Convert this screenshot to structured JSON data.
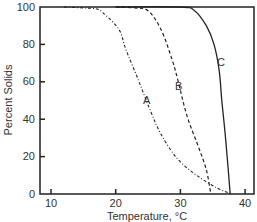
{
  "chart_data": {
    "type": "line",
    "title": "",
    "xlabel": "Temperature, °C",
    "ylabel": "Percent Solids",
    "xlim": [
      8,
      42
    ],
    "ylim": [
      0,
      100
    ],
    "xticks": [
      10,
      20,
      30,
      40
    ],
    "yticks": [
      0,
      20,
      40,
      60,
      80,
      100
    ],
    "grid": false,
    "legend": "inline curve labels",
    "series": [
      {
        "name": "A",
        "style": "dash-dot",
        "x": [
          12,
          15,
          17,
          18,
          20.5,
          21.6,
          23.5,
          25.3,
          27,
          29.5,
          32.5,
          35.8,
          38
        ],
        "y": [
          100,
          99.5,
          99,
          97,
          88,
          77,
          61,
          45,
          32,
          19,
          10,
          3,
          0
        ],
        "label_pos": [
          24.6,
          50
        ]
      },
      {
        "name": "B",
        "style": "dashed",
        "x": [
          20,
          23,
          25,
          27,
          28.7,
          29.6,
          31,
          32.7,
          34,
          34.7
        ],
        "y": [
          100,
          99.5,
          98,
          88,
          72,
          61,
          42,
          26,
          13,
          0
        ],
        "label_pos": [
          29.2,
          57
        ]
      },
      {
        "name": "C",
        "style": "solid",
        "x": [
          20,
          30,
          32.2,
          34,
          35.2,
          36,
          36.4,
          37,
          37.7
        ],
        "y": [
          100,
          100,
          98,
          90,
          80,
          66,
          50,
          29,
          0
        ],
        "label_pos": [
          36.3,
          69
        ]
      }
    ]
  },
  "axes": {
    "y_tick_labels": [
      "0",
      "20",
      "40",
      "60",
      "80",
      "100"
    ],
    "x_tick_labels": [
      "10",
      "20",
      "30",
      "40"
    ],
    "xlabel": "Temperature, °C",
    "ylabel": "Percent Solids"
  },
  "labels": {
    "a": "A",
    "b": "B",
    "c": "C"
  },
  "colors": {
    "line": "#222222",
    "text": "#333333",
    "frame": "#222222"
  }
}
